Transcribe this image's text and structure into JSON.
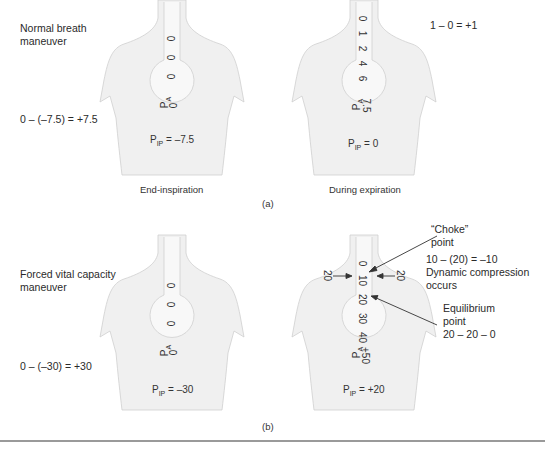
{
  "panel_a": {
    "label": "(a)",
    "maneuver_title": [
      "Normal breath",
      "maneuver"
    ],
    "left": {
      "equation": "0 – (–7.5) = +7.5",
      "airway_values": [
        "0",
        "0",
        "0"
      ],
      "pa_label": "P",
      "pa_sub": "A",
      "pa_value": "0",
      "pip_main": "P",
      "pip_sub": "IP",
      "pip_value": " = –7.5",
      "caption": "End-inspiration"
    },
    "right": {
      "equation": "1 – 0 = +1",
      "airway_values": [
        "0",
        "1",
        "2",
        "4",
        "6"
      ],
      "pa_label": "P",
      "pa_sub": "A",
      "pa_value": "7.5",
      "pip_main": "P",
      "pip_sub": "IP",
      "pip_value": " = 0",
      "caption": "During expiration"
    }
  },
  "panel_b": {
    "label": "(b)",
    "maneuver_title": [
      "Forced vital capacity",
      "maneuver"
    ],
    "left": {
      "equation": "0 – (–30) = +30",
      "airway_values": [
        "0",
        "0",
        "0"
      ],
      "pa_label": "P",
      "pa_sub": "A",
      "pa_value": "0",
      "pip_main": "P",
      "pip_sub": "IP",
      "pip_value": " = –30"
    },
    "right": {
      "airway_values": [
        "0",
        "10",
        "20",
        "30",
        "40"
      ],
      "side_pressure_left": "20",
      "side_pressure_right": "20",
      "pa_label": "P",
      "pa_sub": "A",
      "pa_value": "+50",
      "pip_main": "P",
      "pip_sub": "IP",
      "pip_value": " = +20",
      "choke_label": [
        "“Choke”",
        "point"
      ],
      "choke_equation": [
        "10 – (20) = –10",
        "Dynamic compression",
        "occurs"
      ],
      "equilibrium_label": [
        "Equilibrium",
        "point",
        "20 – 20 – 0"
      ]
    }
  },
  "colors": {
    "torso_fill": "#f0f0f0",
    "torso_stroke": "#c8c8c8",
    "lung_fill": "#f7f7f7",
    "text": "#2a2a2a",
    "rule": "#9a9a9a"
  }
}
